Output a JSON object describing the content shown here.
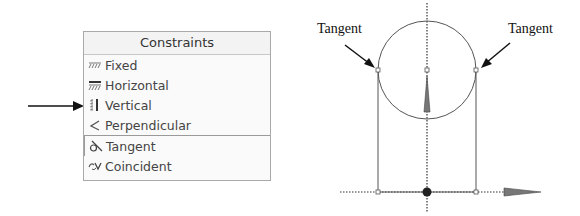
{
  "constraints_panel": {
    "title": "Constraints",
    "items": [
      {
        "label": "Fixed",
        "icon": "fixed-icon"
      },
      {
        "label": "Horizontal",
        "icon": "horizontal-icon"
      },
      {
        "label": "Vertical",
        "icon": "vertical-icon"
      },
      {
        "label": "Perpendicular",
        "icon": "perpendicular-icon"
      },
      {
        "label": "Tangent",
        "icon": "tangent-icon"
      },
      {
        "label": "Coincident",
        "icon": "coincident-icon"
      }
    ],
    "pointed_item": "Vertical"
  },
  "diagram": {
    "labels": {
      "left": "Tangent",
      "right": "Tangent"
    },
    "colors": {
      "lines": "#555555",
      "axis": "#333333",
      "arrow_fill": "#777777"
    }
  }
}
